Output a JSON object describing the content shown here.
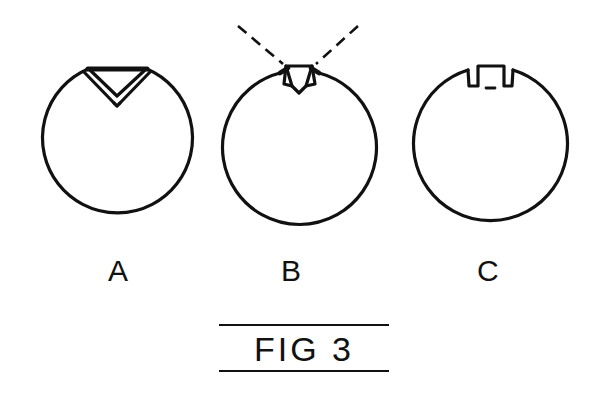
{
  "drawing": {
    "title": "FIG 3",
    "background_color": "#ffffff",
    "ink_color": "#111111",
    "line_width": 3,
    "description": "Patent style line drawing showing three ring cross sections with different notch profiles",
    "figures": [
      {
        "label": "A",
        "notch_type": "v-notch",
        "notch_description": "downward pointing triangular V notch with thick top edge",
        "circle": {
          "cx": 117,
          "cy": 145,
          "r": 75
        },
        "label_position": {
          "x": 108,
          "y": 256
        }
      },
      {
        "label": "B",
        "notch_type": "tapered-notch",
        "notch_description": "narrow tapered trapezoidal notch with shoulder tick marks and two dashed indicator lines converging from above",
        "circle": {
          "cx": 299,
          "cy": 148,
          "r": 77
        },
        "label_position": {
          "x": 281,
          "y": 256
        },
        "leader_lines": [
          {
            "name": "left-dashed-leader",
            "x1": 238,
            "y1": 26,
            "x2": 283,
            "y2": 64
          },
          {
            "name": "right-dashed-leader",
            "x1": 358,
            "y1": 26,
            "x2": 316,
            "y2": 64
          }
        ]
      },
      {
        "label": "C",
        "notch_type": "rectangular-slot",
        "notch_description": "squared U shaped rectangular slot with small dash at base",
        "circle": {
          "cx": 490,
          "cy": 144,
          "r": 77
        },
        "label_position": {
          "x": 477,
          "y": 256
        }
      }
    ],
    "caption": {
      "text": "FIG 3",
      "rule_above": true,
      "rule_below": true,
      "rule_width": 170,
      "position": {
        "x": 219,
        "y": 324
      }
    }
  }
}
